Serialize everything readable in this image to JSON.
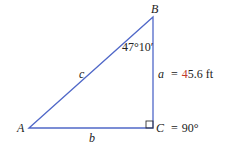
{
  "diagram": {
    "type": "right-triangle",
    "colors": {
      "stroke": "#5068c8",
      "text": "#222222",
      "accent": "#c0392b"
    },
    "vertices": {
      "A": {
        "label": "A",
        "x": 29,
        "y": 128
      },
      "B": {
        "label": "B",
        "x": 153,
        "y": 17
      },
      "C": {
        "label": "C",
        "x": 153,
        "y": 128
      }
    },
    "sides": {
      "a": {
        "label": "a",
        "eq": "=",
        "value_first": "4",
        "value_rest": "5.6",
        "unit": "ft"
      },
      "b": {
        "label": "b"
      },
      "c": {
        "label": "c"
      }
    },
    "angles": {
      "B": {
        "value": "47°10′"
      },
      "C": {
        "label": "C",
        "eq": "=",
        "value": "90°"
      }
    }
  }
}
